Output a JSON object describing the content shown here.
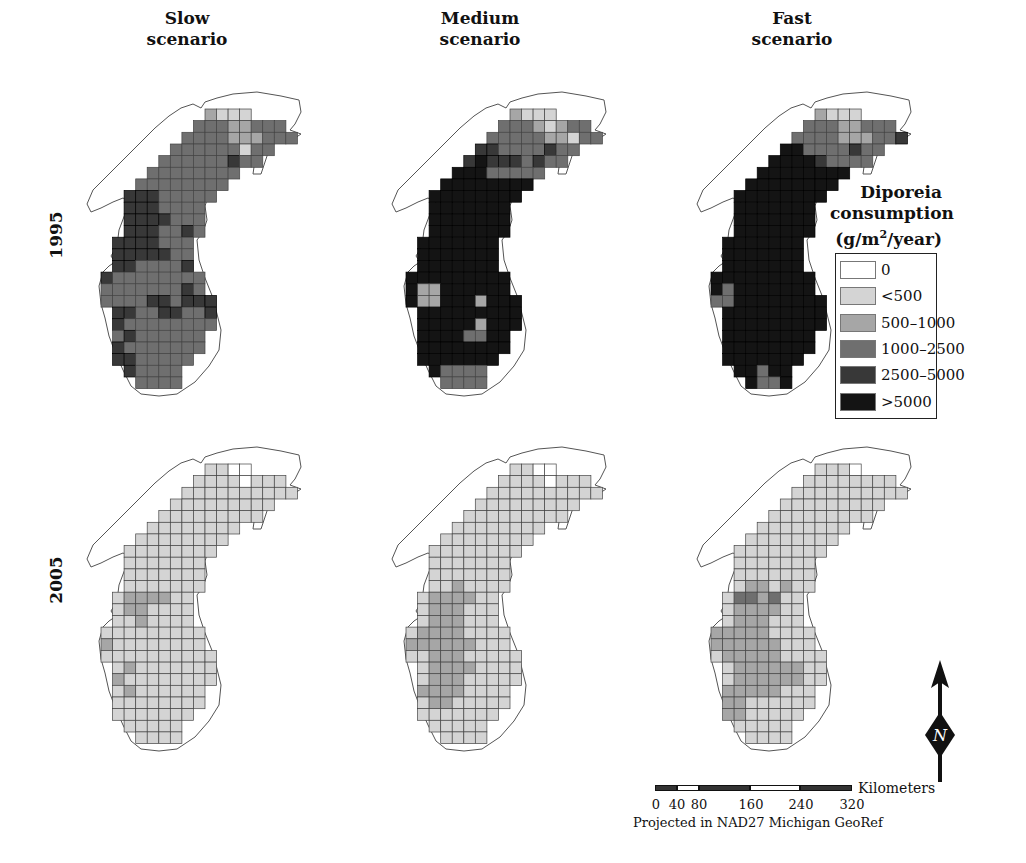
{
  "columns": [
    {
      "line1": "Slow",
      "line2": "scenario"
    },
    {
      "line1": "Medium",
      "line2": "scenario"
    },
    {
      "line1": "Fast",
      "line2": "scenario"
    }
  ],
  "rows": [
    {
      "label": "1995"
    },
    {
      "label": "2005"
    }
  ],
  "legend": {
    "title_line1": "Diporeia",
    "title_line2": "consumption",
    "title_line3_prefix": "(g/m",
    "title_line3_sup": "2",
    "title_line3_suffix": "/year)",
    "items": [
      {
        "label": "0",
        "color": "#ffffff"
      },
      {
        "label": "<500",
        "color": "#d4d4d4"
      },
      {
        "label": "500–1000",
        "color": "#a6a6a6"
      },
      {
        "label": "1000–2500",
        "color": "#6f6f6f"
      },
      {
        "label": "2500–5000",
        "color": "#383838"
      },
      {
        "label": ">5000",
        "color": "#141414"
      }
    ]
  },
  "scale_bar": {
    "unit": "Kilometers",
    "ticks": [
      "0",
      "40",
      "80",
      "160",
      "240",
      "320"
    ],
    "projection": "Projected in NAD27 Michigan GeoRef"
  },
  "north_arrow": {
    "label": "N"
  },
  "chart_data": {
    "type": "heatmap",
    "legend_bins": [
      "0",
      "<500",
      "500-1000",
      "1000-2500",
      "2500-5000",
      ">5000"
    ],
    "grid_shape": [
      [
        9,
        12
      ],
      [
        8,
        15
      ],
      [
        7,
        16
      ],
      [
        6,
        14
      ],
      [
        5,
        13
      ],
      [
        4,
        11
      ],
      [
        3,
        10
      ],
      [
        2,
        9
      ],
      [
        2,
        8
      ],
      [
        2,
        8
      ],
      [
        2,
        8
      ],
      [
        1,
        7
      ],
      [
        1,
        7
      ],
      [
        1,
        7
      ],
      [
        0,
        8
      ],
      [
        0,
        8
      ],
      [
        0,
        9
      ],
      [
        1,
        9
      ],
      [
        1,
        9
      ],
      [
        1,
        8
      ],
      [
        1,
        8
      ],
      [
        1,
        7
      ],
      [
        2,
        6
      ],
      [
        3,
        6
      ]
    ],
    "maps": [
      {
        "year": "1995",
        "scenario": "Slow",
        "rows": [
          "2111",
          "33322333",
          "3333222333",
          "333333133",
          "333333433",
          "33333333",
          "33333333",
          "44433333",
          "4443333",
          "4444333",
          "4443343",
          "4444333",
          "4444433",
          "4433334",
          "433333333",
          "333333343",
          "3333443444",
          "443344334",
          "433333333",
          "34333333",
          "43333333",
          "4433333",
          "43333",
          "3333"
        ]
      },
      {
        "year": "1995",
        "scenario": "Medium",
        "rows": [
          "2111",
          "33321233",
          "3333322133",
          "443333433",
          "454443433",
          "55533333",
          "55555555",
          "55555555",
          "5555555",
          "5555555",
          "5555555",
          "5555555",
          "5555555",
          "5555555",
          "555555555",
          "522555555",
          "5225552555",
          "555555555",
          "555552555",
          "55553355",
          "55555555",
          "5555555",
          "53333",
          "3333"
        ]
      },
      {
        "year": "1995",
        "scenario": "Fast",
        "rows": [
          "2111",
          "33322333",
          "3333222334",
          "553333433",
          "555543333",
          "55555555",
          "55555555",
          "55555555",
          "5555555",
          "5555555",
          "5555555",
          "5555555",
          "5555555",
          "5555555",
          "555555555",
          "535555555",
          "3355555555",
          "555555555",
          "555555555",
          "55555555",
          "55555555",
          "5555555",
          "55355",
          "5335"
        ]
      },
      {
        "year": "2005",
        "scenario": "Slow",
        "rows": [
          "1100",
          "11110111",
          "1111111111",
          "111111111",
          "111111111",
          "11111111",
          "11111111",
          "11111111",
          "1111111",
          "1111111",
          "1111111",
          "1222211",
          "1221111",
          "1121111",
          "111111111",
          "211111111",
          "1111111111",
          "121111111",
          "211111111",
          "12111111",
          "11111111",
          "1111111",
          "11111",
          "1111"
        ]
      },
      {
        "year": "2005",
        "scenario": "Medium",
        "rows": [
          "1100",
          "11110111",
          "1111111111",
          "111111111",
          "111111111",
          "11111111",
          "11111111",
          "11111111",
          "1111111",
          "1111111",
          "1121111",
          "1222211",
          "1222111",
          "1222111",
          "122221111",
          "222222111",
          "1122211111",
          "122221111",
          "122211111",
          "22221111",
          "12211111",
          "1111111",
          "11111",
          "1111"
        ]
      },
      {
        "year": "2005",
        "scenario": "Fast",
        "rows": [
          "1110",
          "11111111",
          "1111111111",
          "111111111",
          "111111111",
          "11111111",
          "11111111",
          "11111111",
          "1111111",
          "1111111",
          "1221211",
          "1332311",
          "1222211",
          "1222111",
          "222221111",
          "222222111",
          "1222221111",
          "122222211",
          "122222211",
          "22222111",
          "22111111",
          "2211111",
          "11111",
          "1111"
        ]
      }
    ]
  }
}
